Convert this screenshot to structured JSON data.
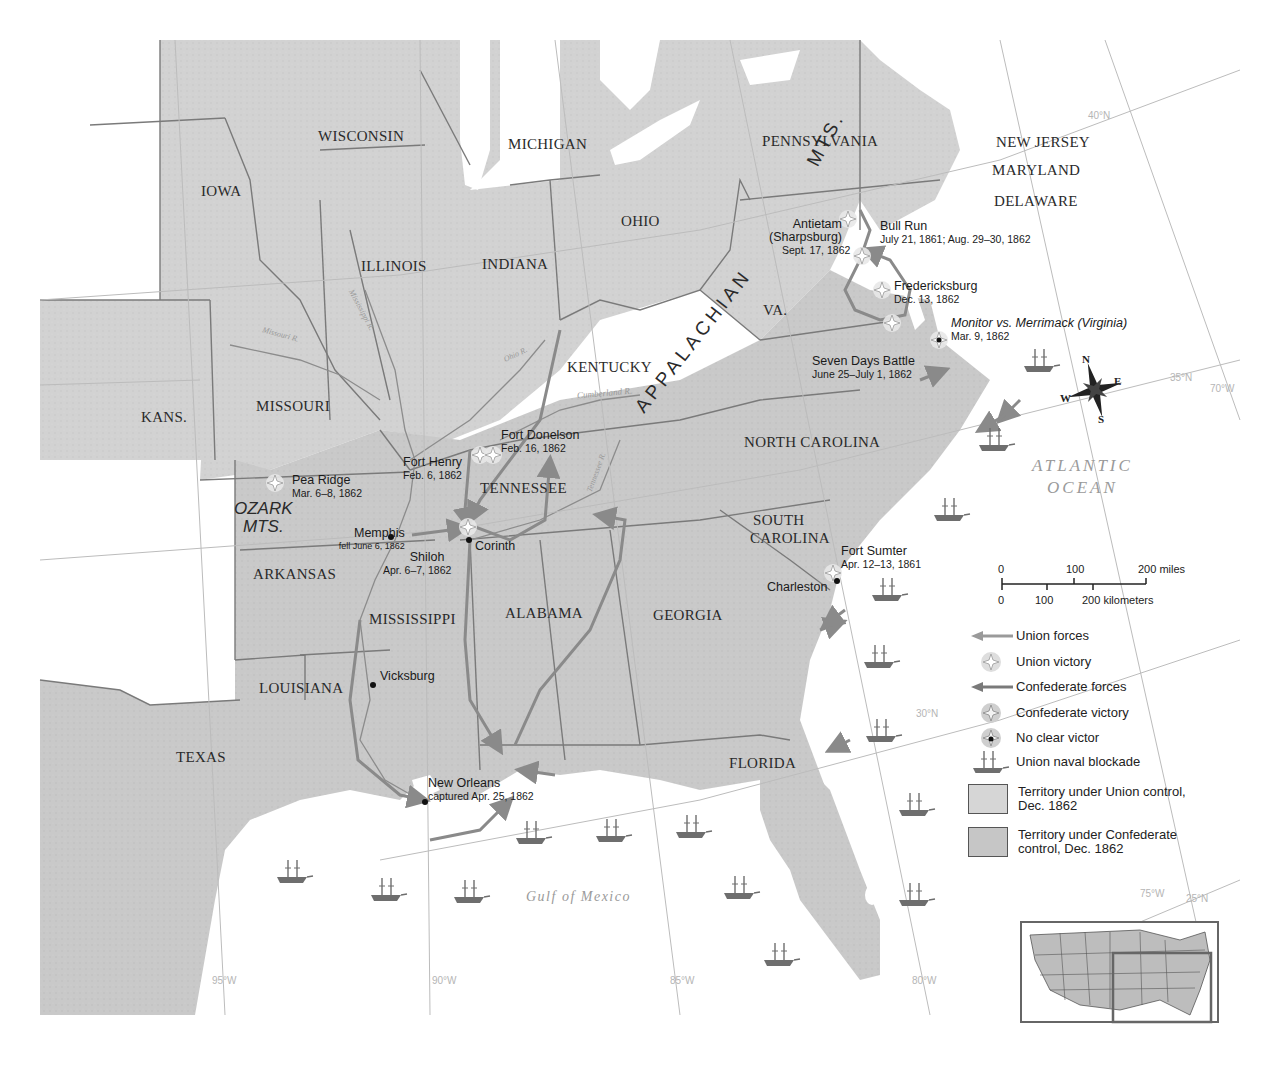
{
  "map": {
    "title": "",
    "colors": {
      "land": "#d4d4d4",
      "land_dark": "#c8c8c8",
      "water": "#ffffff",
      "border": "#7a7a7a",
      "graticule": "#b8b8b8",
      "route": "#8a8a8a",
      "text": "#222222"
    },
    "states": [
      {
        "name": "WISCONSIN"
      },
      {
        "name": "MICHIGAN"
      },
      {
        "name": "PENNSYLVANIA"
      },
      {
        "name": "NEW JERSEY"
      },
      {
        "name": "MARYLAND"
      },
      {
        "name": "DELAWARE"
      },
      {
        "name": "IOWA"
      },
      {
        "name": "OHIO"
      },
      {
        "name": "ILLINOIS"
      },
      {
        "name": "INDIANA"
      },
      {
        "name": "KENTUCKY"
      },
      {
        "name": "VA."
      },
      {
        "name": "KANS."
      },
      {
        "name": "MISSOURI"
      },
      {
        "name": "NORTH CAROLINA"
      },
      {
        "name": "TENNESSEE"
      },
      {
        "name": "SOUTH"
      },
      {
        "name": "CAROLINA"
      },
      {
        "name": "ARKANSAS"
      },
      {
        "name": "MISSISSIPPI"
      },
      {
        "name": "ALABAMA"
      },
      {
        "name": "GEORGIA"
      },
      {
        "name": "LOUISIANA"
      },
      {
        "name": "TEXAS"
      },
      {
        "name": "FLORIDA"
      }
    ],
    "mountains": {
      "appalachian_1": "APPALACHIAN",
      "appalachian_2": "MTS.",
      "ozark_1": "OZARK",
      "ozark_2": "MTS."
    },
    "rivers": [
      "Mississippi R.",
      "Missouri R.",
      "Ohio R.",
      "Cumberland R.",
      "Tennessee R."
    ],
    "water_bodies": {
      "atlantic_1": "ATLANTIC",
      "atlantic_2": "OCEAN",
      "gulf": "Gulf of Mexico"
    },
    "battles": [
      {
        "name": "Antietam",
        "name2": "(Sharpsburg)",
        "date": "Sept. 17, 1862",
        "outcome": "Union victory"
      },
      {
        "name": "Bull Run",
        "date": "July 21, 1861; Aug. 29–30, 1862",
        "outcome": "Confederate victory"
      },
      {
        "name": "Fredericksburg",
        "date": "Dec. 13, 1862",
        "outcome": "Confederate victory"
      },
      {
        "name": "Monitor vs. Merrimack (Virginia)",
        "date": "Mar. 9, 1862",
        "outcome": "No clear victor"
      },
      {
        "name": "Seven Days Battle",
        "date": "June 25–July 1, 1862",
        "outcome": "Confederate victory"
      },
      {
        "name": "Fort Donelson",
        "date": "Feb. 16, 1862",
        "outcome": "Union victory"
      },
      {
        "name": "Fort Henry",
        "date": "Feb. 6, 1862",
        "outcome": "Union victory"
      },
      {
        "name": "Pea Ridge",
        "date": "Mar. 6–8, 1862",
        "outcome": "Union victory"
      },
      {
        "name": "Shiloh",
        "date": "Apr. 6–7, 1862",
        "outcome": "Union victory"
      },
      {
        "name": "Fort Sumter",
        "date": "Apr. 12–13, 1861",
        "outcome": "Confederate victory"
      }
    ],
    "cities": [
      {
        "name": "Memphis",
        "note": "fell June 6, 1862"
      },
      {
        "name": "Corinth"
      },
      {
        "name": "Vicksburg"
      },
      {
        "name": "New Orleans",
        "note": "captured Apr. 25, 1862"
      },
      {
        "name": "Charleston"
      }
    ],
    "graticule": {
      "lat": [
        "40°N",
        "35°N",
        "30°N",
        "25°N"
      ],
      "lon": [
        "95°W",
        "90°W",
        "85°W",
        "80°W",
        "75°W",
        "70°W"
      ]
    },
    "compass": {
      "n": "N",
      "s": "S",
      "e": "E",
      "w": "W"
    },
    "scale": {
      "miles_ticks": [
        "0",
        "100",
        "200 miles"
      ],
      "km_ticks": [
        "0",
        "100",
        "200 kilometers"
      ]
    },
    "legend": [
      {
        "label": "Union forces",
        "icon": "union-arrow-icon"
      },
      {
        "label": "Union victory",
        "icon": "union-victory-burst-icon"
      },
      {
        "label": "Confederate forces",
        "icon": "confederate-arrow-icon"
      },
      {
        "label": "Confederate victory",
        "icon": "confederate-victory-burst-icon"
      },
      {
        "label": "No clear victor",
        "icon": "no-clear-victor-burst-icon"
      },
      {
        "label": "Union naval blockade",
        "icon": "ship-icon"
      },
      {
        "label": "Territory under Union control,",
        "label2": "Dec. 1862",
        "icon": "union-territory-swatch"
      },
      {
        "label": "Territory under Confederate",
        "label2": "control, Dec. 1862",
        "icon": "confederate-territory-swatch"
      }
    ]
  }
}
